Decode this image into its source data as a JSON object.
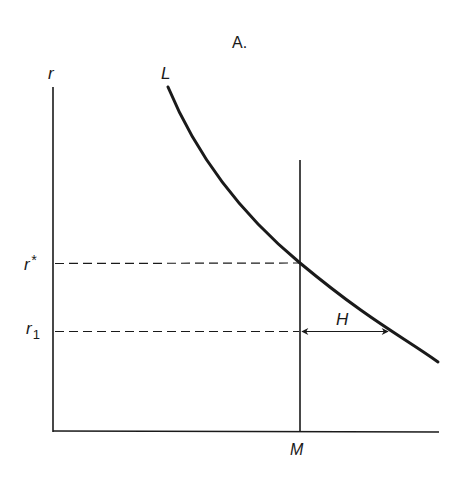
{
  "title": "A.",
  "axes": {
    "y_label": "r",
    "x_label": "M"
  },
  "curve": {
    "label": "L"
  },
  "levels": {
    "r_star": {
      "base": "r",
      "sup": "*"
    },
    "r_1": {
      "base": "r",
      "sub": "1"
    }
  },
  "gap": {
    "label": "H"
  },
  "colors": {
    "ink": "#1a1a1a",
    "background": "#ffffff"
  }
}
